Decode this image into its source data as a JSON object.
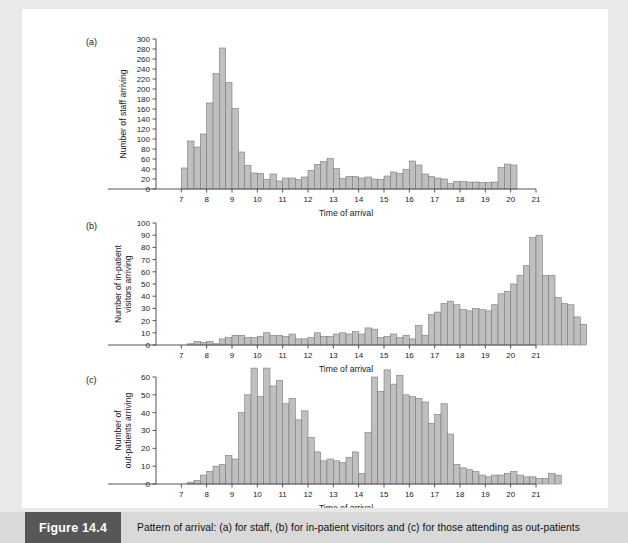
{
  "figure": {
    "number_label": "Figure 14.4",
    "caption": "Pattern of arrival: (a) for staff, (b) for in-patient visitors and (c) for those attending as out-patients",
    "accent_color": "#575757",
    "caption_band_color": "#d9d9d9",
    "bar_fill_color": "#bfbfbf",
    "bar_stroke_color": "#7a7a7a",
    "page_background": "#e9e9e9",
    "plot_background": "#ffffff"
  },
  "chart_data": [
    {
      "id": "panel-a",
      "type": "bar",
      "panel_label": "(a)",
      "title": "",
      "xlabel": "Time of arrival",
      "ylabel": "Number of staff arriving",
      "ylim": [
        0,
        300
      ],
      "ytick_step": 20,
      "yticks": [
        0,
        20,
        40,
        60,
        80,
        100,
        120,
        140,
        160,
        180,
        200,
        220,
        240,
        260,
        280,
        300
      ],
      "xlim": [
        6,
        21
      ],
      "xticks": [
        7,
        8,
        9,
        10,
        11,
        12,
        13,
        14,
        15,
        16,
        17,
        18,
        19,
        20,
        21
      ],
      "xtick_labels": [
        "7",
        "8",
        "9",
        "10",
        "11",
        "12",
        "13",
        "14",
        "15",
        "16",
        "17",
        "18",
        "19",
        "20",
        "21"
      ],
      "bin_width_hours": 0.25,
      "bin_start": 7.0,
      "grid": false,
      "legend": "none",
      "values": [
        42,
        96,
        84,
        110,
        172,
        231,
        282,
        213,
        161,
        74,
        47,
        32,
        31,
        19,
        30,
        16,
        22,
        22,
        19,
        24,
        37,
        49,
        55,
        61,
        41,
        21,
        25,
        25,
        22,
        24,
        20,
        19,
        26,
        34,
        31,
        39,
        56,
        48,
        30,
        25,
        22,
        20,
        11,
        15,
        15,
        14,
        14,
        13,
        13,
        14,
        43,
        50,
        48
      ]
    },
    {
      "id": "panel-b",
      "type": "bar",
      "panel_label": "(b)",
      "title": "",
      "xlabel": "Time of arrival",
      "ylabel": "Number of in-patient visitors arriving",
      "ylim": [
        0,
        100
      ],
      "ytick_step": 10,
      "yticks": [
        0,
        10,
        20,
        30,
        40,
        50,
        60,
        70,
        80,
        90,
        100
      ],
      "xlim": [
        6,
        21
      ],
      "xticks": [
        7,
        8,
        9,
        10,
        11,
        12,
        13,
        14,
        15,
        16,
        17,
        18,
        19,
        20,
        21
      ],
      "xtick_labels": [
        "7",
        "8",
        "9",
        "10",
        "11",
        "12",
        "13",
        "14",
        "15",
        "16",
        "17",
        "18",
        "19",
        "20",
        "21"
      ],
      "bin_width_hours": 0.25,
      "bin_start": 7.0,
      "grid": false,
      "legend": "none",
      "values": [
        0,
        1,
        3,
        2,
        3,
        1,
        5,
        6,
        8,
        8,
        6,
        6,
        7,
        10,
        8,
        8,
        7,
        9,
        5,
        5,
        6,
        10,
        7,
        7,
        9,
        10,
        9,
        11,
        9,
        14,
        13,
        6,
        7,
        9,
        6,
        8,
        5,
        16,
        8,
        25,
        27,
        34,
        36,
        33,
        29,
        28,
        30,
        29,
        28,
        33,
        42,
        44,
        50,
        57,
        65,
        88,
        90,
        57,
        57,
        39,
        34,
        33,
        23,
        17
      ]
    },
    {
      "id": "panel-c",
      "type": "bar",
      "panel_label": "(c)",
      "title": "",
      "xlabel": "Time of arrival",
      "ylabel": "Number of out-patients arriving",
      "ylim": [
        0,
        60
      ],
      "ytick_step": 10,
      "yticks": [
        0,
        10,
        20,
        30,
        40,
        50,
        60
      ],
      "xlim": [
        6,
        21
      ],
      "xticks": [
        7,
        8,
        9,
        10,
        11,
        12,
        13,
        14,
        15,
        16,
        17,
        18,
        19,
        20,
        21
      ],
      "xtick_labels": [
        "7",
        "8",
        "9",
        "10",
        "11",
        "12",
        "13",
        "14",
        "15",
        "16",
        "17",
        "18",
        "19",
        "20",
        "21"
      ],
      "bin_width_hours": 0.25,
      "bin_start": 7.0,
      "grid": false,
      "legend": "none",
      "values": [
        0,
        1,
        2,
        5,
        7,
        10,
        11,
        16,
        14,
        40,
        50,
        65,
        49,
        65,
        55,
        58,
        45,
        48,
        36,
        41,
        26,
        18,
        13,
        14,
        13,
        12,
        15,
        18,
        6,
        29,
        60,
        52,
        64,
        56,
        61,
        50,
        49,
        48,
        46,
        34,
        39,
        45,
        28,
        11,
        9,
        8,
        7,
        5,
        4,
        5,
        5,
        6,
        7,
        5,
        4,
        4,
        3,
        3,
        6,
        5
      ]
    }
  ]
}
